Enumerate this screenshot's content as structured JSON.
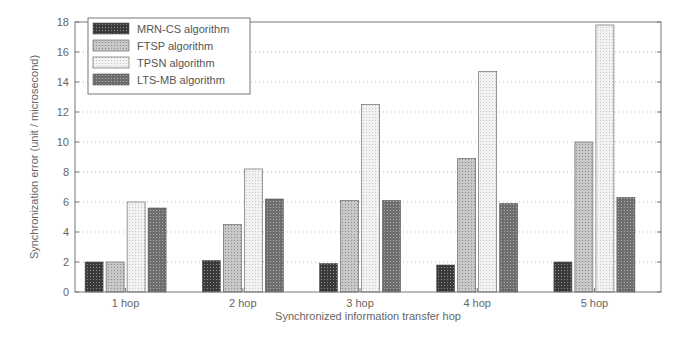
{
  "chart_data": {
    "type": "bar",
    "title": "",
    "xlabel": "Synchronized information transfer hop",
    "ylabel": "Synchronization error (unit / microsecond)",
    "ylim": [
      0,
      18
    ],
    "yticks": [
      0,
      2,
      4,
      6,
      8,
      10,
      12,
      14,
      16,
      18
    ],
    "grid": true,
    "legend_position": "upper-left",
    "categories": [
      "1 hop",
      "2 hop",
      "3 hop",
      "4 hop",
      "5 hop"
    ],
    "series": [
      {
        "name": "MRN-CS algorithm",
        "values": [
          2.0,
          2.1,
          1.9,
          1.8,
          2.0
        ],
        "color": "#4a4a4a"
      },
      {
        "name": "FTSP algorithm",
        "values": [
          2.0,
          4.5,
          6.1,
          8.9,
          10.0
        ],
        "color": "#bdbdbd"
      },
      {
        "name": "TPSN algorithm",
        "values": [
          6.0,
          8.2,
          12.5,
          14.7,
          17.8
        ],
        "color": "#ececec"
      },
      {
        "name": "LTS-MB algorithm",
        "values": [
          5.6,
          6.2,
          6.1,
          5.9,
          6.3
        ],
        "color": "#7a7a7a"
      }
    ]
  }
}
